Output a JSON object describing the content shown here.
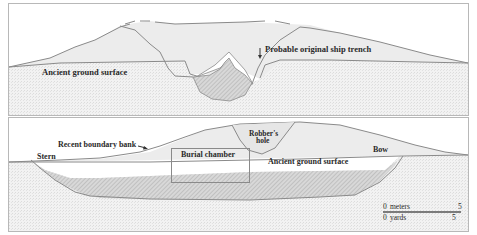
{
  "top_panel": {
    "title": "Transverse section",
    "labels": {
      "ancient_ground": "Ancient ground surface",
      "ship_trench": "Probable original ship trench"
    }
  },
  "bottom_panel": {
    "title": "Longitudinal section",
    "labels": {
      "boundary_bank": "Recent boundary bank",
      "stern": "Stern",
      "burial_chamber": "Burial chamber",
      "robbers_hole_line1": "Robber's",
      "robbers_hole_line2": "hole",
      "ancient_ground": "Ancient ground surface",
      "bow": "Bow"
    },
    "scale": {
      "meters_start": "0",
      "meters_label": "meters",
      "meters_end": "5",
      "yards_start": "0",
      "yards_label": "yards",
      "yards_end": "5"
    }
  },
  "colors": {
    "soil": "#f1f1f1",
    "mound": "#ececec",
    "line": "#8a8a8a",
    "hatch": "#9a9a9a",
    "frame": "#b8b8b8",
    "text": "#2a2a2a"
  }
}
